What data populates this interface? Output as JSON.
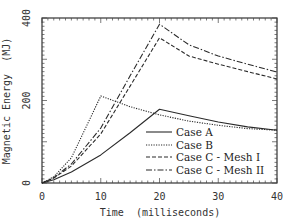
{
  "chart_data": {
    "type": "line",
    "title": "",
    "xlabel": "Time  (milliseconds)",
    "ylabel": "Magnetic Energy  (MJ)",
    "xlim": [
      0,
      40
    ],
    "ylim": [
      0,
      400
    ],
    "xticks": [
      "0",
      "10",
      "20",
      "30",
      "40"
    ],
    "yticks": [
      "0",
      "200",
      "400"
    ],
    "grid": false,
    "legend_position": "lower right",
    "series": [
      {
        "name": "Case A",
        "style": "solid",
        "x": [
          0,
          2,
          5,
          10,
          15,
          20,
          25,
          30,
          35,
          40
        ],
        "y": [
          0,
          8,
          27,
          68,
          122,
          179,
          163,
          148,
          136,
          128
        ]
      },
      {
        "name": "Case B",
        "style": "dotted",
        "x": [
          0,
          2,
          5,
          10,
          15,
          20,
          25,
          30,
          35,
          40
        ],
        "y": [
          0,
          15,
          61,
          211,
          185,
          165,
          150,
          140,
          132,
          128
        ]
      },
      {
        "name": "Case C - Mesh I",
        "style": "dashed",
        "x": [
          0,
          2,
          5,
          10,
          15,
          20,
          25,
          30,
          35,
          40
        ],
        "y": [
          0,
          12,
          41,
          119,
          235,
          352,
          308,
          288,
          270,
          252
        ]
      },
      {
        "name": "Case C - Mesh II",
        "style": "dash-dot",
        "x": [
          0,
          2,
          5,
          10,
          15,
          20,
          25,
          30,
          35,
          40
        ],
        "y": [
          0,
          13,
          46,
          133,
          260,
          385,
          335,
          308,
          288,
          269
        ]
      }
    ]
  },
  "legend": {
    "items": [
      "Case A",
      "Case B",
      "Case C - Mesh I",
      "Case C - Mesh II"
    ]
  },
  "axes": {
    "x_label": "Time  (milliseconds)",
    "y_label": "Magnetic Energy  (MJ)",
    "x_ticks": [
      "0",
      "10",
      "20",
      "30",
      "40"
    ],
    "y_ticks": [
      "0",
      "200",
      "400"
    ]
  },
  "colors": {
    "line": "#2a2a2a",
    "axis": "#333333",
    "background": "#ffffff"
  }
}
